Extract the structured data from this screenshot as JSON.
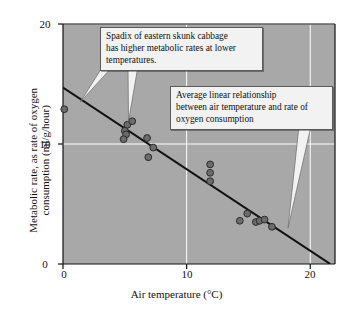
{
  "chart_data": {
    "type": "scatter",
    "title": "",
    "xlabel": "Air temperature (°C)",
    "ylabel": "Metabolic rate, as rate of oxygen\nconsumption (ml/g/hour)",
    "xlim": [
      0,
      22
    ],
    "ylim": [
      0,
      20
    ],
    "xticks": [
      0,
      10,
      20
    ],
    "xtick_labels": [
      "0",
      "10",
      "20"
    ],
    "yticks": [
      0,
      10,
      20
    ],
    "ytick_labels": [
      "0",
      "10",
      "20"
    ],
    "grid": true,
    "grid_color": "#ffffff",
    "plot_background": "#a8a8a8",
    "point_color": "#6b6b6b",
    "point_edge_color": "#2b2b2b",
    "point_radius": 3.4,
    "legend": "none",
    "series": [
      {
        "name": "Spadix oxygen consumption",
        "points": [
          {
            "x": 0.1,
            "y": 12.9
          },
          {
            "x": 5.2,
            "y": 11.6
          },
          {
            "x": 5.0,
            "y": 11.1
          },
          {
            "x": 5.1,
            "y": 10.8
          },
          {
            "x": 4.9,
            "y": 10.4
          },
          {
            "x": 5.6,
            "y": 11.9
          },
          {
            "x": 6.8,
            "y": 10.5
          },
          {
            "x": 7.3,
            "y": 9.7
          },
          {
            "x": 6.9,
            "y": 8.9
          },
          {
            "x": 11.9,
            "y": 8.3
          },
          {
            "x": 11.9,
            "y": 7.6
          },
          {
            "x": 11.9,
            "y": 6.9
          },
          {
            "x": 14.3,
            "y": 3.6
          },
          {
            "x": 14.9,
            "y": 4.2
          },
          {
            "x": 15.6,
            "y": 3.5
          },
          {
            "x": 15.9,
            "y": 3.6
          },
          {
            "x": 16.3,
            "y": 3.7
          },
          {
            "x": 16.9,
            "y": 3.1
          }
        ]
      }
    ],
    "trendline": {
      "name": "Average linear relationship",
      "type": "linear",
      "intercept": 14.7,
      "slope": -0.68,
      "x_start": 0.0,
      "x_end": 21.6,
      "color": "#111111"
    },
    "annotations": [
      {
        "id": "spadix",
        "text": "Spadix of eastern skunk cabbage\nhas higher metabolic rates at lower\ntemperatures.",
        "pointer_targets": [
          [
            1.4,
            13.5
          ],
          [
            5.3,
            11.9
          ]
        ]
      },
      {
        "id": "regression",
        "text": "Average linear relationship\nbetween air temperature and rate of\noxygen consumption",
        "pointer_targets": [
          [
            18.2,
            3.0
          ]
        ]
      }
    ]
  }
}
